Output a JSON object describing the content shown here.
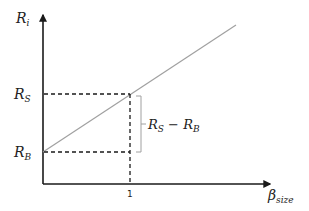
{
  "diagram": {
    "y_axis_label": {
      "main": "R",
      "sub": "i"
    },
    "x_axis_label": {
      "main": "β",
      "sub": "size"
    },
    "y_ticks": [
      {
        "main": "R",
        "sub": "S"
      },
      {
        "main": "R",
        "sub": "B"
      }
    ],
    "x_ticks": [
      "1"
    ],
    "bracket_label": {
      "a_main": "R",
      "a_sub": "S",
      "op": " − ",
      "b_main": "R",
      "b_sub": "B"
    },
    "colors": {
      "axis": "#1a1a1a",
      "line": "#a0a0a0",
      "dash": "#1a1a1a",
      "bracket": "#a0a0a0"
    }
  }
}
